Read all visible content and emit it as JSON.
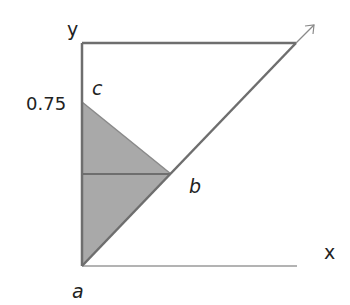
{
  "diagram": {
    "axis_labels": {
      "x": "x",
      "y": "y"
    },
    "tick_labels": {
      "y_tick": "0.75"
    },
    "vertex_labels": {
      "a": "a",
      "b": "b",
      "c": "c"
    },
    "colors": {
      "shade": "#a9a9a9",
      "line": "#6e6e6e",
      "axis": "#9a9a9a",
      "text": "#222222"
    },
    "points": {
      "a": [
        82,
        266
      ],
      "b": [
        171,
        174
      ],
      "c": [
        82,
        102
      ],
      "top_left": [
        82,
        43
      ],
      "top_right": [
        296,
        43
      ],
      "arrow_tip": [
        314,
        25
      ],
      "x_axis_end": [
        297,
        266
      ]
    }
  }
}
